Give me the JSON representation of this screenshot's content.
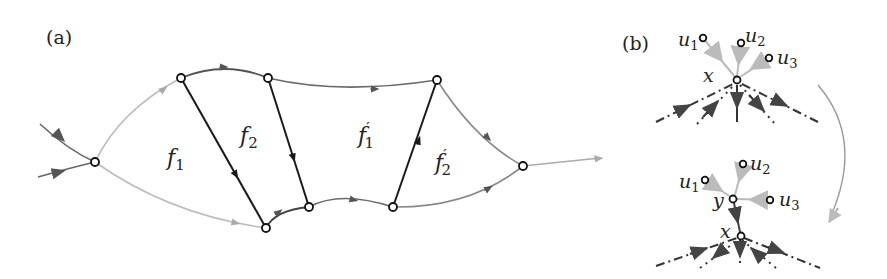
{
  "panels": {
    "a": {
      "label": "(a)",
      "face_labels": {
        "f1": {
          "base": "f",
          "sub": "1"
        },
        "f2": {
          "base": "f",
          "sub": "2"
        },
        "f1p": {
          "base": "f",
          "prime": "′",
          "sub": "1"
        },
        "f2p": {
          "base": "f",
          "prime": "′",
          "sub": "2"
        }
      },
      "nodes": [
        {
          "id": "A",
          "x": 95,
          "y": 162
        },
        {
          "id": "B",
          "x": 181,
          "y": 78
        },
        {
          "id": "C",
          "x": 268,
          "y": 78
        },
        {
          "id": "D",
          "x": 266,
          "y": 228
        },
        {
          "id": "E",
          "x": 309,
          "y": 207
        },
        {
          "id": "F",
          "x": 393,
          "y": 207
        },
        {
          "id": "G",
          "x": 437,
          "y": 80
        },
        {
          "id": "H",
          "x": 523,
          "y": 166
        }
      ]
    },
    "b": {
      "label": "(b)",
      "top": {
        "center_label": "x",
        "neighbors": [
          {
            "base": "u",
            "sub": "1"
          },
          {
            "base": "u",
            "sub": "2"
          },
          {
            "base": "u",
            "sub": "3"
          }
        ]
      },
      "bottom": {
        "new_vertex_label": "y",
        "center_label": "x",
        "neighbors": [
          {
            "base": "u",
            "sub": "1"
          },
          {
            "base": "u",
            "sub": "2"
          },
          {
            "base": "u",
            "sub": "3"
          }
        ]
      }
    }
  },
  "colors": {
    "dark_edge": "#1a1a1a",
    "mid_edge": "#6b6b6b",
    "light_edge": "#b8b8b8",
    "arrow_light": "#aaaaaa",
    "arrow_mid": "#555555"
  }
}
